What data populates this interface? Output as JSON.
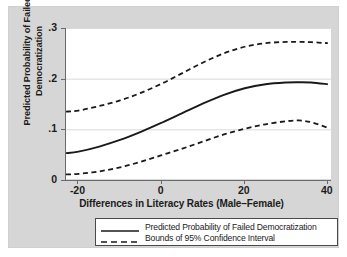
{
  "chart_data": {
    "type": "line",
    "title": "",
    "xlabel": "Differences in Literacy Rates (Male–Female)",
    "ylabel": "Predicted Probability of Failed Democratization",
    "ylabel_line1": "Predicted Probability of Failed",
    "ylabel_line2": "Democratization",
    "xlim": [
      -23,
      41
    ],
    "ylim": [
      0,
      0.3
    ],
    "xticks": [
      -20,
      0,
      20,
      40
    ],
    "xtick_labels": [
      "-20",
      "0",
      "20",
      "40"
    ],
    "yticks": [
      0,
      0.1,
      0.2,
      0.3
    ],
    "ytick_labels": [
      "0",
      ".1",
      ".2",
      ".3"
    ],
    "grid": "horizontal",
    "legend_position": "below-plot",
    "line_color": "#1a1a1a",
    "grid_color": "#d9d9d9",
    "plot_background": "#ffffff",
    "graph_background": "#d6d6d6",
    "x": [
      -23,
      -20,
      -15,
      -10,
      -5,
      0,
      5,
      10,
      15,
      20,
      25,
      30,
      33,
      36,
      40
    ],
    "series": [
      {
        "name": "Predicted Probability of Failed Democratization",
        "style": "solid",
        "values": [
          0.053,
          0.056,
          0.066,
          0.079,
          0.095,
          0.113,
          0.132,
          0.151,
          0.168,
          0.181,
          0.189,
          0.1925,
          0.193,
          0.1925,
          0.189
        ]
      },
      {
        "name": "Bounds of 95% Confidence Interval (upper)",
        "style": "dashed",
        "values": [
          0.135,
          0.137,
          0.146,
          0.157,
          0.172,
          0.19,
          0.211,
          0.232,
          0.25,
          0.263,
          0.27,
          0.2725,
          0.2725,
          0.272,
          0.27
        ]
      },
      {
        "name": "Bounds of 95% Confidence Interval (lower)",
        "style": "dashed",
        "values": [
          0.011,
          0.012,
          0.017,
          0.025,
          0.036,
          0.049,
          0.062,
          0.076,
          0.09,
          0.101,
          0.11,
          0.116,
          0.1175,
          0.114,
          0.103
        ]
      }
    ],
    "legend_entries": [
      {
        "label": "Predicted Probability of Failed Democratization",
        "style": "solid"
      },
      {
        "label": "Bounds of 95% Confidence Interval",
        "style": "dashed"
      }
    ]
  }
}
